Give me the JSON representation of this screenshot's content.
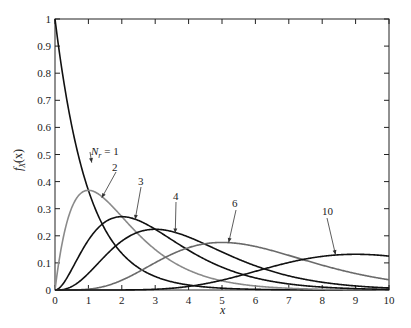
{
  "chart_data": {
    "type": "line",
    "title": "",
    "xlabel": "x",
    "ylabel": "f_X(x)",
    "xlim": [
      0,
      10
    ],
    "ylim": [
      0,
      1
    ],
    "grid": false,
    "legend": "inline labels with arrows",
    "xticks": [
      "0",
      "1",
      "2",
      "3",
      "4",
      "5",
      "6",
      "7",
      "8",
      "9",
      "10"
    ],
    "yticks": [
      "0",
      "0.1",
      "0.2",
      "0.3",
      "0.4",
      "0.5",
      "0.6",
      "0.7",
      "0.8",
      "0.9",
      "1"
    ],
    "x": [
      0,
      0.5,
      1,
      1.5,
      2,
      2.5,
      3,
      3.5,
      4,
      4.5,
      5,
      5.5,
      6,
      6.5,
      7,
      7.5,
      8,
      8.5,
      9,
      9.5,
      10
    ],
    "series": [
      {
        "name": "N_r = 1",
        "label": "N_r = 1",
        "color": "#111111",
        "values": [
          1.0,
          0.607,
          0.368,
          0.223,
          0.135,
          0.082,
          0.05,
          0.03,
          0.018,
          0.011,
          0.007,
          0.004,
          0.002,
          0.002,
          0.001,
          0.001,
          0.0,
          0.0,
          0.0,
          0.0,
          0.0
        ]
      },
      {
        "name": "2",
        "label": "2",
        "color": "#8a8a8a",
        "values": [
          0.0,
          0.303,
          0.368,
          0.335,
          0.271,
          0.205,
          0.149,
          0.106,
          0.073,
          0.05,
          0.034,
          0.022,
          0.015,
          0.01,
          0.006,
          0.004,
          0.003,
          0.002,
          0.001,
          0.001,
          0.0
        ]
      },
      {
        "name": "3",
        "label": "3",
        "color": "#111111",
        "values": [
          0.0,
          0.076,
          0.184,
          0.251,
          0.271,
          0.257,
          0.224,
          0.185,
          0.147,
          0.112,
          0.084,
          0.061,
          0.045,
          0.033,
          0.022,
          0.016,
          0.011,
          0.008,
          0.005,
          0.004,
          0.002
        ]
      },
      {
        "name": "4",
        "label": "4",
        "color": "#111111",
        "values": [
          0.0,
          0.013,
          0.061,
          0.126,
          0.18,
          0.214,
          0.224,
          0.216,
          0.195,
          0.169,
          0.14,
          0.112,
          0.089,
          0.069,
          0.052,
          0.039,
          0.029,
          0.021,
          0.015,
          0.011,
          0.008
        ]
      },
      {
        "name": "6",
        "label": "6",
        "color": "#6a6a6a",
        "values": [
          0.0,
          0.0,
          0.003,
          0.013,
          0.036,
          0.067,
          0.101,
          0.132,
          0.156,
          0.171,
          0.175,
          0.171,
          0.161,
          0.146,
          0.128,
          0.109,
          0.092,
          0.075,
          0.061,
          0.048,
          0.038
        ]
      },
      {
        "name": "10",
        "label": "10",
        "color": "#111111",
        "values": [
          0.0,
          0.0,
          0.0,
          0.0,
          0.0,
          0.001,
          0.003,
          0.007,
          0.013,
          0.023,
          0.036,
          0.05,
          0.069,
          0.087,
          0.101,
          0.115,
          0.124,
          0.13,
          0.132,
          0.129,
          0.125
        ]
      }
    ],
    "annotations": [
      {
        "text": "N_r = 1",
        "arrow_to": [
          1.1,
          0.47
        ]
      },
      {
        "text": "2",
        "arrow_to": [
          1.4,
          0.34
        ]
      },
      {
        "text": "3",
        "arrow_to": [
          2.4,
          0.26
        ]
      },
      {
        "text": "4",
        "arrow_to": [
          3.6,
          0.21
        ]
      },
      {
        "text": "6",
        "arrow_to": [
          5.2,
          0.175
        ]
      },
      {
        "text": "10",
        "arrow_to": [
          8.4,
          0.13
        ]
      }
    ]
  },
  "labels": {
    "xlabel": "x",
    "ylabel_f": "f",
    "ylabel_sub": "X",
    "ylabel_arg": "(x)",
    "n1_N": "N",
    "n1_sub": "r",
    "n1_eq": " = 1",
    "n2": "2",
    "n3": "3",
    "n4": "4",
    "n6": "6",
    "n10": "10"
  }
}
